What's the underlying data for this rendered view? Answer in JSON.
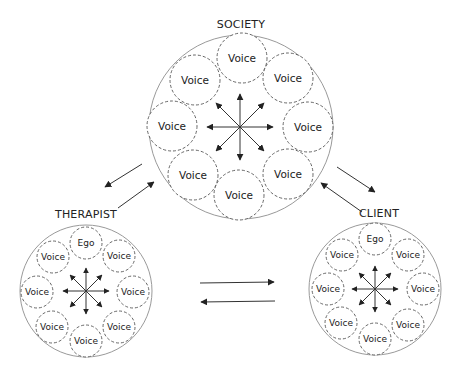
{
  "diagram": {
    "groups": [
      {
        "id": "society",
        "label": "SOCIETY",
        "center": [
          241,
          127
        ],
        "radius": 92,
        "inner_radius": 25,
        "nodes": [
          {
            "label": "Voice",
            "pos": [
              242,
              58
            ]
          },
          {
            "label": "Voice",
            "pos": [
              288,
              78
            ]
          },
          {
            "label": "Voice",
            "pos": [
              308,
              127
            ]
          },
          {
            "label": "Voice",
            "pos": [
              288,
              174
            ]
          },
          {
            "label": "Voice",
            "pos": [
              239,
              195
            ]
          },
          {
            "label": "Voice",
            "pos": [
              193,
              175
            ]
          },
          {
            "label": "Voice",
            "pos": [
              172,
              126
            ]
          },
          {
            "label": "Voice",
            "pos": [
              195,
              80
            ]
          }
        ]
      },
      {
        "id": "therapist",
        "label": "THERAPIST",
        "center": [
          86,
          291
        ],
        "radius": 66,
        "inner_radius": 16,
        "nodes": [
          {
            "label": "Ego",
            "pos": [
              86,
              243
            ]
          },
          {
            "label": "Voice",
            "pos": [
              119,
              256
            ]
          },
          {
            "label": "Voice",
            "pos": [
              133,
              292
            ]
          },
          {
            "label": "Voice",
            "pos": [
              119,
              327
            ]
          },
          {
            "label": "Voice",
            "pos": [
              86,
              341
            ]
          },
          {
            "label": "Voice",
            "pos": [
              52,
              327
            ]
          },
          {
            "label": "Voice",
            "pos": [
              37,
              292
            ]
          },
          {
            "label": "Voice",
            "pos": [
              53,
              257
            ]
          }
        ]
      },
      {
        "id": "client",
        "label": "CLIENT",
        "center": [
          375,
          289
        ],
        "radius": 66,
        "inner_radius": 16,
        "nodes": [
          {
            "label": "Ego",
            "pos": [
              375,
              239
            ]
          },
          {
            "label": "Voice",
            "pos": [
              408,
              255
            ]
          },
          {
            "label": "Voice",
            "pos": [
              423,
              289
            ]
          },
          {
            "label": "Voice",
            "pos": [
              408,
              325
            ]
          },
          {
            "label": "Voice",
            "pos": [
              375,
              339
            ]
          },
          {
            "label": "Voice",
            "pos": [
              341,
              323
            ]
          },
          {
            "label": "Voice",
            "pos": [
              328,
              289
            ]
          },
          {
            "label": "Voice",
            "pos": [
              342,
              255
            ]
          }
        ]
      }
    ],
    "connections": [
      {
        "from": "society",
        "to": "therapist"
      },
      {
        "from": "therapist",
        "to": "society"
      },
      {
        "from": "society",
        "to": "client"
      },
      {
        "from": "client",
        "to": "society"
      },
      {
        "from": "therapist",
        "to": "client"
      },
      {
        "from": "client",
        "to": "therapist"
      }
    ],
    "colors": {
      "outer_stroke": "#9a9a9a",
      "inner_stroke": "#555555",
      "arrow": "#333333",
      "text": "#222222"
    }
  }
}
